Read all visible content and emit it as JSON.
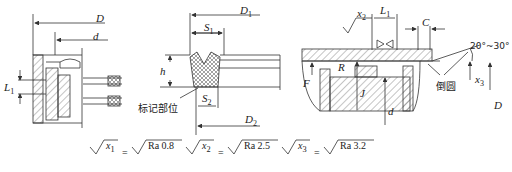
{
  "figure": {
    "left_view": {
      "labels": {
        "D": "D",
        "d": "d",
        "L1": "L",
        "L1_sub": "1"
      }
    },
    "middle_view": {
      "labels": {
        "D1": "D",
        "D1_sub": "1",
        "S1": "S",
        "S1_sub": "1",
        "h": "h",
        "S2": "S",
        "S2_sub": "2",
        "D2": "D",
        "D2_sub": "2",
        "mark_position": "标记部位"
      }
    },
    "right_view": {
      "labels": {
        "L1": "L",
        "L1_sub": "1",
        "C": "C",
        "x2": "x",
        "x2_sub": "2",
        "x3": "x",
        "x3_sub": "3",
        "angle": "20°~30°",
        "R": "R",
        "chamfer": "倒圆",
        "D": "D",
        "d": "d",
        "F": "F",
        "J": "J"
      }
    }
  },
  "legend": [
    {
      "symbol": "x",
      "sub": "1",
      "equals": "=",
      "value": "Ra 0.8"
    },
    {
      "symbol": "x",
      "sub": "2",
      "equals": "=",
      "value": "Ra 2.5"
    },
    {
      "symbol": "x",
      "sub": "3",
      "equals": "=",
      "value": "Ra 3.2"
    }
  ],
  "colors": {
    "line": "#333333",
    "hatch": "#555555",
    "background": "#ffffff"
  }
}
